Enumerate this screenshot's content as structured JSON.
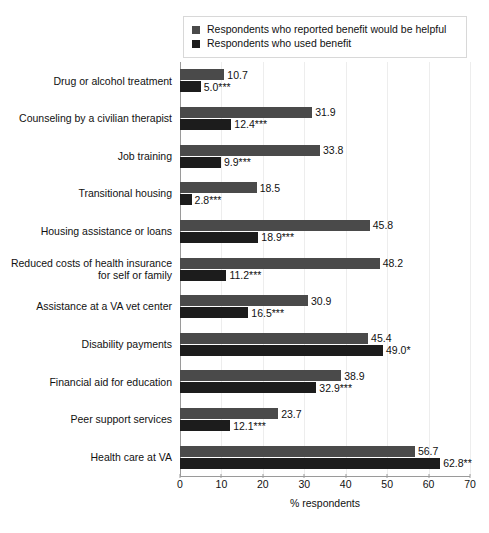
{
  "chart_data": {
    "type": "bar",
    "orientation": "horizontal",
    "title": "",
    "xlabel": "% respondents",
    "ylabel": "",
    "xlim": [
      0,
      70
    ],
    "xticks": [
      0,
      10,
      20,
      30,
      40,
      50,
      60,
      70
    ],
    "grid": true,
    "legend_position": "top",
    "categories": [
      "Drug or alcohol treatment",
      "Counseling by a civilian therapist",
      "Job training",
      "Transitional housing",
      "Housing assistance or loans",
      "Reduced costs of health insurance\nfor self or family",
      "Assistance at a VA vet center",
      "Disability payments",
      "Financial aid for education",
      "Peer support services",
      "Health care at VA"
    ],
    "series": [
      {
        "name": "Respondents who reported benefit would be helpful",
        "color": "#4a4a4a",
        "values": [
          10.7,
          31.9,
          33.8,
          18.5,
          45.8,
          48.2,
          30.9,
          45.4,
          38.9,
          23.7,
          56.7
        ],
        "labels": [
          "10.7",
          "31.9",
          "33.8",
          "18.5",
          "45.8",
          "48.2",
          "30.9",
          "45.4",
          "38.9",
          "23.7",
          "56.7"
        ]
      },
      {
        "name": "Respondents who used benefit",
        "color": "#1c1c1c",
        "values": [
          5.0,
          12.4,
          9.9,
          2.8,
          18.9,
          11.2,
          16.5,
          49.0,
          32.9,
          12.1,
          62.8
        ],
        "labels": [
          "5.0***",
          "12.4***",
          "9.9***",
          "2.8***",
          "18.9***",
          "11.2***",
          "16.5***",
          "49.0*",
          "32.9***",
          "12.1***",
          "62.8**"
        ]
      }
    ]
  },
  "legend": {
    "items": [
      {
        "label": "Respondents who reported benefit would be helpful",
        "color": "#4a4a4a"
      },
      {
        "label": "Respondents who used benefit",
        "color": "#1c1c1c"
      }
    ]
  },
  "axis": {
    "x_label": "% respondents",
    "x_ticks": [
      "0",
      "10",
      "20",
      "30",
      "40",
      "50",
      "60",
      "70"
    ]
  }
}
